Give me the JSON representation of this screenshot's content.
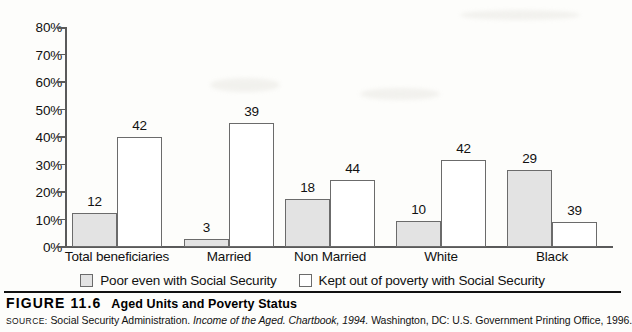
{
  "chart_data": {
    "type": "bar",
    "title": "Aged Units and Poverty Status",
    "xlabel": "",
    "ylabel": "",
    "ylim": [
      0,
      80
    ],
    "ytick_labels": [
      "0%",
      "10%",
      "20%",
      "30%",
      "40%",
      "50%",
      "60%",
      "70%",
      "80%"
    ],
    "ytick_values": [
      0,
      10,
      20,
      30,
      40,
      50,
      60,
      70,
      80
    ],
    "grid": false,
    "legend_position": "bottom",
    "categories": [
      "Total beneficiaries",
      "Married",
      "Non Married",
      "White",
      "Black"
    ],
    "series": [
      {
        "name": "Poor even with Social Security",
        "color": "#e3e3e3",
        "values": [
          12,
          3,
          18,
          10,
          29
        ],
        "labels": [
          "12",
          "3",
          "18",
          "10",
          "29"
        ],
        "drawn_heights": [
          12.5,
          3,
          17.5,
          9.5,
          28
        ]
      },
      {
        "name": "Kept out of poverty with Social Security",
        "color": "#ffffff",
        "values": [
          42,
          39,
          44,
          42,
          39
        ],
        "labels": [
          "42",
          "39",
          "44",
          "42",
          "39"
        ],
        "drawn_heights": [
          40,
          45,
          24.5,
          31.5,
          9
        ]
      }
    ]
  },
  "legend": {
    "items": [
      {
        "label": "Poor even with Social Security",
        "swatch": "poor"
      },
      {
        "label": "Kept out of poverty with Social Security",
        "swatch": "kept"
      }
    ]
  },
  "caption": {
    "figure_number": "FIGURE 11.6",
    "title": "Aged Units and Poverty Status",
    "source_prefix": "SOURCE:",
    "source_part1": "Social Security Administration.",
    "source_italic1": "Income of the Aged. Chartbook,",
    "source_italic2": "1994.",
    "source_part2": "Washington, DC: U.S. Government Printing Office, 1996."
  }
}
